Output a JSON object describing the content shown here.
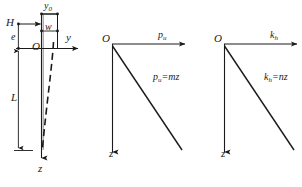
{
  "figure": {
    "name": "pile-lateral-load-diagrams",
    "panels": [
      {
        "id": "panel-pile",
        "name": "pile-geometry-panel",
        "labels": {
          "horizontal_force": "H",
          "eccentricity": "e",
          "origin": "O",
          "axis_horizontal": "y",
          "axis_vertical": "z",
          "pile_width": "w",
          "ground_deflection": "y",
          "ground_deflection_sub": "0",
          "embedded_length": "L"
        }
      },
      {
        "id": "panel-pu",
        "name": "ultimate-soil-resistance-panel",
        "labels": {
          "origin": "O",
          "axis_horizontal": "p",
          "axis_horizontal_sub": "u",
          "axis_vertical": "z",
          "equation_lhs": "p",
          "equation_lhs_sub": "u",
          "equation_rhs": "=mz"
        }
      },
      {
        "id": "panel-kh",
        "name": "subgrade-modulus-panel",
        "labels": {
          "origin": "O",
          "axis_horizontal": "k",
          "axis_horizontal_sub": "h",
          "axis_vertical": "z",
          "equation_lhs": "k",
          "equation_lhs_sub": "h",
          "equation_rhs": "=nz"
        }
      }
    ],
    "colors": {
      "line": "#1a1a1a",
      "dashed_line": "#222222",
      "background": "#ffffff"
    }
  }
}
